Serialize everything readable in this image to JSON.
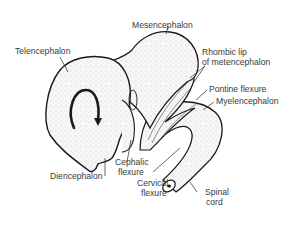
{
  "diagram": {
    "labels": {
      "telencephalon": "Telencephalon",
      "mesencephalon": "Mesencephalon",
      "rhombic_lip_1": "Rhombic lip",
      "rhombic_lip_2": "of metencephalon",
      "pontine_flexure": "Pontine flexure",
      "myelencephalon": "Myelencephalon",
      "diencephalon": "Diencephalon",
      "cephalic_flexure_1": "Cephalic",
      "cephalic_flexure_2": "flexure",
      "cervical_flexure_1": "Cervical",
      "cervical_flexure_2": "flexure",
      "spinal_cord_1": "Spinal",
      "spinal_cord_2": "cord"
    },
    "colors": {
      "line": "#1a1a1a",
      "fill": "#f3f3f3",
      "stipple": "#9a9a9a",
      "text": "#3a3a3a"
    }
  }
}
